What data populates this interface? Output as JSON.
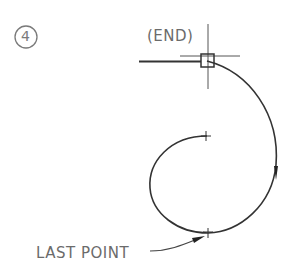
{
  "step": {
    "number": "4"
  },
  "labels": {
    "end": "(END)",
    "last_point": "LAST POINT"
  },
  "colors": {
    "line": "#333333",
    "text": "#6b6b6b",
    "step_circle": "#7a7a7a"
  }
}
